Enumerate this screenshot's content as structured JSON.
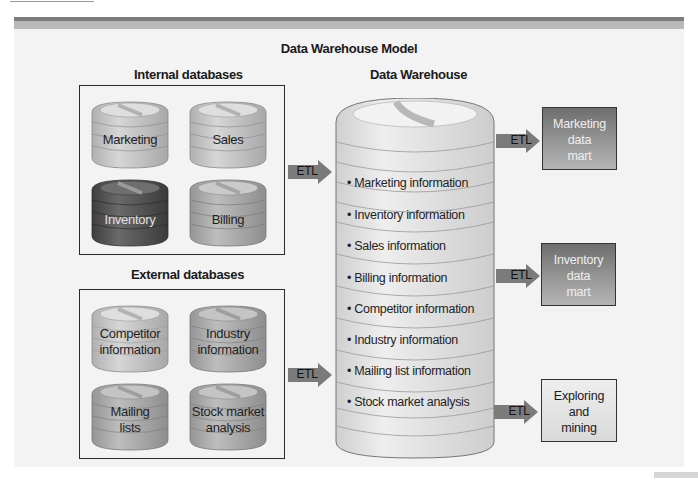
{
  "diagram": {
    "title": "Data Warehouse Model",
    "internal": {
      "heading": "Internal databases",
      "databases": [
        {
          "label": "Marketing",
          "shade": "light"
        },
        {
          "label": "Sales",
          "shade": "light"
        },
        {
          "label": "Inventory",
          "shade": "dark"
        },
        {
          "label": "Billing",
          "shade": "light"
        }
      ]
    },
    "external": {
      "heading": "External databases",
      "databases": [
        {
          "line1": "Competitor",
          "line2": "information",
          "shade": "light"
        },
        {
          "line1": "Industry",
          "line2": "information",
          "shade": "medium"
        },
        {
          "line1": "Mailing",
          "line2": "lists",
          "shade": "medium"
        },
        {
          "line1": "Stock market",
          "line2": "analysis",
          "shade": "medium"
        }
      ]
    },
    "etl_label": "ETL",
    "warehouse": {
      "heading": "Data Warehouse",
      "items": [
        "Marketing information",
        "Inventory information",
        "Sales information",
        "Billing information",
        "Competitor information",
        "Industry information",
        "Mailing list information",
        "Stock market analysis"
      ]
    },
    "outputs": [
      {
        "line1": "Marketing",
        "line2": "data",
        "line3": "mart",
        "style": "dark"
      },
      {
        "line1": "Inventory",
        "line2": "data",
        "line3": "mart",
        "style": "dark"
      },
      {
        "line1": "Exploring",
        "line2": "and",
        "line3": "mining",
        "style": "light"
      }
    ],
    "colors": {
      "cylinder_light": "#c9c9c9",
      "cylinder_medium": "#a9a9a9",
      "cylinder_dark": "#5a5a5a",
      "arrow": "#7b7b7b",
      "warehouse": "#e4e4e4",
      "panel": "#f3f3f3"
    }
  }
}
